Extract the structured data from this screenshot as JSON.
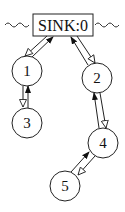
{
  "diagram": {
    "sink": {
      "label": "SINK:0",
      "x": 62,
      "y": 15,
      "w": 50,
      "h": 22
    },
    "nodes": [
      {
        "id": "1",
        "label": "1",
        "cx": 27,
        "cy": 71,
        "r": 15
      },
      {
        "id": "2",
        "label": "2",
        "cx": 97,
        "cy": 78,
        "r": 15
      },
      {
        "id": "3",
        "label": "3",
        "cx": 27,
        "cy": 123,
        "r": 15
      },
      {
        "id": "4",
        "label": "4",
        "cx": 103,
        "cy": 143,
        "r": 15
      },
      {
        "id": "5",
        "label": "5",
        "cx": 65,
        "cy": 186,
        "r": 15
      }
    ],
    "edges": [
      {
        "from": "1",
        "to": "SINK",
        "style": "filled-arrow"
      },
      {
        "from": "SINK",
        "to": "1",
        "style": "hollow-arrow"
      },
      {
        "from": "2",
        "to": "SINK",
        "style": "filled-arrow"
      },
      {
        "from": "SINK",
        "to": "2",
        "style": "hollow-arrow"
      },
      {
        "from": "3",
        "to": "1",
        "style": "filled-arrow"
      },
      {
        "from": "1",
        "to": "3",
        "style": "hollow-arrow"
      },
      {
        "from": "4",
        "to": "2",
        "style": "filled-arrow"
      },
      {
        "from": "2",
        "to": "4",
        "style": "hollow-arrow"
      },
      {
        "from": "5",
        "to": "4",
        "style": "filled-arrow"
      },
      {
        "from": "4",
        "to": "5",
        "style": "hollow-arrow"
      }
    ],
    "wavy_lines": [
      "left-of-sink",
      "right-of-sink"
    ],
    "colors": {
      "stroke": "#222222",
      "background": "#ffffff"
    }
  }
}
